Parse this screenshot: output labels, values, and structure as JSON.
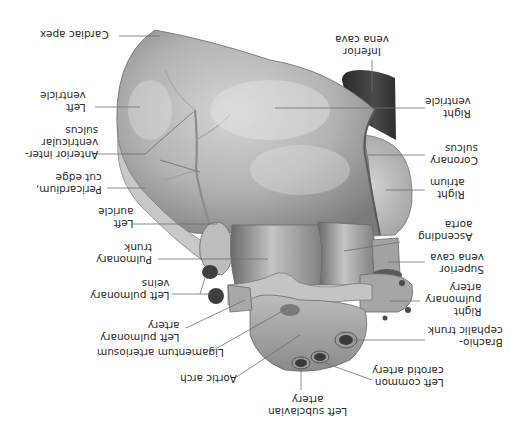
{
  "figure": {
    "orientation": "rotated 180 degrees",
    "colors": {
      "background": "#ffffff",
      "tissue_light": "#d9d9d9",
      "tissue_mid": "#a8a8a8",
      "tissue_dark": "#5e5e5e",
      "vessel_dark": "#3a3a3a",
      "leader_line": "#6e6e6e",
      "label_text": "#2a2a2a"
    }
  },
  "labels": {
    "cardiac_apex": "Cardiac apex",
    "inferior_vena_cava": "Inferior\nvena cava",
    "left_ventricle": "Left\nventricle",
    "right_ventricle": "Right\nventricle",
    "anterior_interventricular_sulcus": "Anterior inter-\nventricular\nsulcus",
    "coronary_sulcus": "Coronary\nsulcus",
    "pericardium_cut_edge": "Pericardium,\ncut edge",
    "right_atrium": "Right\natrium",
    "left_auricle": "Left\nauricle",
    "ascending_aorta": "Ascending\naorta",
    "pulmonary_trunk": "Pulmonary\ntrunk",
    "superior_vena_cava": "Superior\nvena cava",
    "left_pulmonary_veins": "Left pulmonary\nveins",
    "right_pulmonary_artery": "Right\npulmonary\nartery",
    "left_pulmonary_artery": "Left pulmonary\nartery",
    "ligamentum_arteriosum": "Ligamentum arteriosum",
    "brachiocephalic_trunk": "Brachio-\ncephalic trunk",
    "aortic_arch": "Aortic arch",
    "left_common_carotid_artery": "Left common\ncarotid artery",
    "left_subclavian_artery": "Left subclavian\nartery"
  }
}
